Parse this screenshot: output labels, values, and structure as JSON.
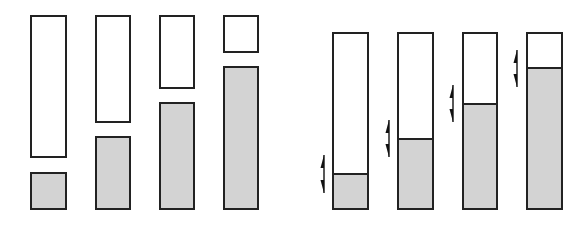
{
  "figure": {
    "colors": {
      "stroke": "#222222",
      "empty_fill": "#ffffff",
      "filled_fill": "#d3d3d3",
      "arrow": "#111111"
    },
    "left_group": {
      "description": "Separated pairs: empty block above, filled block below",
      "columns": [
        {
          "x": 31,
          "w": 35,
          "white_top": 16,
          "white_bottom": 157,
          "grey_top": 173,
          "grey_bottom": 209
        },
        {
          "x": 96,
          "w": 34,
          "white_top": 16,
          "white_bottom": 122,
          "grey_top": 137,
          "grey_bottom": 209
        },
        {
          "x": 160,
          "w": 34,
          "white_top": 16,
          "white_bottom": 88,
          "grey_top": 103,
          "grey_bottom": 209
        },
        {
          "x": 224,
          "w": 34,
          "white_top": 16,
          "white_bottom": 52,
          "grey_top": 67,
          "grey_bottom": 209
        }
      ]
    },
    "right_group": {
      "description": "Single column with movable boundary between filled and empty parts; double arrows mark the movable boundary",
      "columns": [
        {
          "x": 333,
          "w": 35,
          "top": 33,
          "divider": 174,
          "bottom": 209,
          "arrow_x": 324,
          "arrow_top": 155,
          "arrow_bottom": 193
        },
        {
          "x": 398,
          "w": 35,
          "top": 33,
          "divider": 139,
          "bottom": 209,
          "arrow_x": 389,
          "arrow_top": 120,
          "arrow_bottom": 157
        },
        {
          "x": 463,
          "w": 34,
          "top": 33,
          "divider": 104,
          "bottom": 209,
          "arrow_x": 453,
          "arrow_top": 85,
          "arrow_bottom": 122
        },
        {
          "x": 527,
          "w": 35,
          "top": 33,
          "divider": 68,
          "bottom": 209,
          "arrow_x": 517,
          "arrow_top": 50,
          "arrow_bottom": 87
        }
      ]
    },
    "icons": {
      "boundary_arrow": "double-headed-vertical-arrow-icon"
    }
  }
}
